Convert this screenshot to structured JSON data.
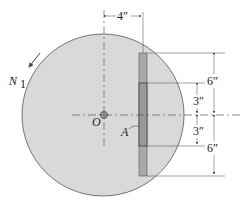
{
  "diagram": {
    "type": "mechanics-figure",
    "labels": {
      "rotation": "N",
      "rotation_sub": "1",
      "center": "O",
      "plate": "A"
    },
    "dimensions": {
      "horizontal_offset": "4″",
      "upper_outer": "6″",
      "upper_inner": "3″",
      "lower_inner": "3″",
      "lower_outer": "6″"
    },
    "colors": {
      "disk_fill": "#d9d9d9",
      "disk_stroke": "#555555",
      "plate_fill": "#a9a9a9",
      "plate_inner_fill": "#9a9a9a",
      "line": "#444444"
    }
  }
}
